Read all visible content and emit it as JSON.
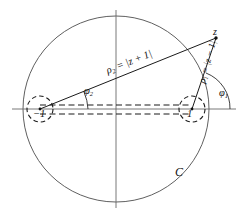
{
  "figure": {
    "type": "geometry-diagram",
    "labels": {
      "rho2": "ρ₂ = |z + 1|",
      "rho2_symbol": "ρ",
      "rho2_sub": "2",
      "rho2_expr": " = |z + 1|",
      "rho1_symbol": "ρ",
      "rho1_sub": "1",
      "rho1_expr": " = |z − 1|",
      "phi1_symbol": "φ",
      "phi1_sub": "1",
      "phi2_symbol": "φ",
      "phi2_sub": "2",
      "point_z": "z",
      "branch_left": "−1",
      "branch_right": "1",
      "curve_C": "C"
    },
    "geometry": {
      "big_circle": {
        "cx": 116,
        "cy": 109,
        "r": 93,
        "label": "C",
        "stroke": "#555555"
      },
      "axes": {
        "horizontal": {
          "x1": 12,
          "y1": 109,
          "x2": 236,
          "y2": 109
        },
        "vertical": {
          "x1": 116,
          "y1": 10,
          "x2": 116,
          "y2": 208
        }
      },
      "branch_points": [
        {
          "name": "-1",
          "x": 40,
          "y": 109,
          "dashed_circle_r": 13
        },
        {
          "name": "+1",
          "x": 192,
          "y": 109,
          "dashed_circle_r": 13
        }
      ],
      "point_z": {
        "x": 216,
        "y": 38
      },
      "cut_lines": [
        {
          "name": "upper-dashed-cut",
          "x1": 40,
          "y1": 105,
          "x2": 192,
          "y2": 105
        },
        {
          "name": "lower-dashed-cut",
          "x1": 40,
          "y1": 114,
          "x2": 192,
          "y2": 114
        }
      ],
      "rays": [
        {
          "name": "ray-rho2",
          "from": [
            40,
            109
          ],
          "to": [
            216,
            38
          ]
        },
        {
          "name": "ray-rho1",
          "from": [
            192,
            109
          ],
          "to": [
            216,
            38
          ]
        }
      ],
      "angle_arcs": [
        {
          "name": "phi1-arc",
          "cx": 192,
          "cy": 109,
          "r": 38
        },
        {
          "name": "phi2-arc",
          "cx": 40,
          "cy": 109,
          "r": 48
        }
      ],
      "colors": {
        "ink": "#111111",
        "line": "#555555",
        "dashed": "#222222"
      }
    }
  }
}
